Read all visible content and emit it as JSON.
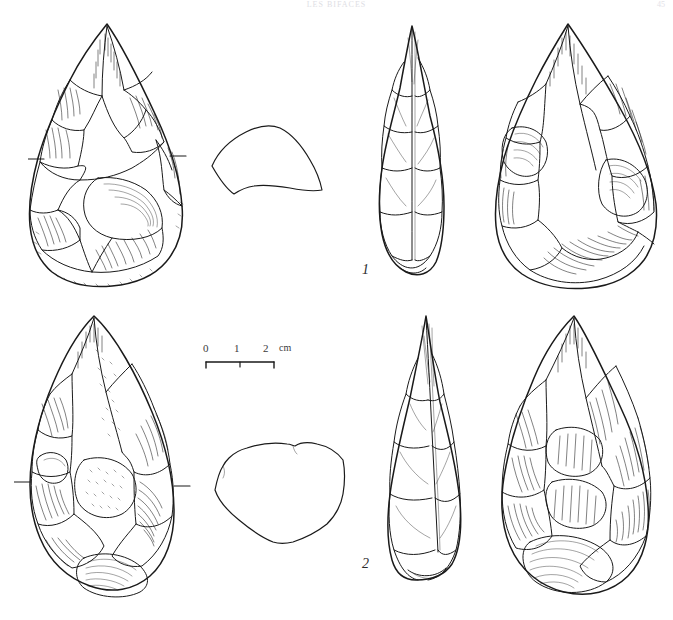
{
  "page": {
    "header_text": "LES BIFACES",
    "page_number": "45",
    "background_color": "#ffffff",
    "ink_color": "#1a1a1a"
  },
  "plate": {
    "title": "Lithic illustration plate — two Acheulean handaxes (bifaces)",
    "figure_count": 2
  },
  "scale": {
    "label_0": "0",
    "label_1": "1",
    "label_2": "2",
    "unit": "cm",
    "total_cm": 2,
    "bar_length_px": 68
  },
  "figures": [
    {
      "number": "1",
      "label": "1",
      "description": "Amygdaloid handaxe, cordiform biface",
      "views": [
        {
          "name": "dorsal-view",
          "position": "top-left"
        },
        {
          "name": "cross-section",
          "position": "top-center-left",
          "shape": "plano-convex lenticular"
        },
        {
          "name": "profile-view",
          "position": "top-center-right"
        },
        {
          "name": "ventral-view",
          "position": "top-right"
        }
      ],
      "orientation_ticks": 2
    },
    {
      "number": "2",
      "label": "2",
      "description": "Ovate / lanceolate handaxe, pointed biface",
      "views": [
        {
          "name": "dorsal-view",
          "position": "bottom-left"
        },
        {
          "name": "cross-section",
          "position": "bottom-center-left",
          "shape": "irregular sub-triangular"
        },
        {
          "name": "profile-view",
          "position": "bottom-center-right"
        },
        {
          "name": "ventral-view",
          "position": "bottom-right"
        }
      ],
      "orientation_ticks": 2
    }
  ]
}
